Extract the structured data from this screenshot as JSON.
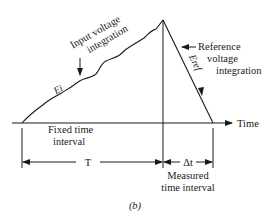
{
  "diagram": {
    "type": "dual-slope integrating ADC waveform",
    "labels": {
      "input_integration_line1": "Input voltage",
      "input_integration_line2": "integration",
      "reference_integration_line1": "Reference",
      "reference_integration_line2": "voltage",
      "reference_integration_line3": "integration",
      "input_voltage_symbol": "Ei",
      "reference_voltage_symbol": "Eref",
      "time_axis": "Time",
      "fixed_interval_line1": "Fixed time",
      "fixed_interval_line2": "interval",
      "fixed_interval_symbol": "T",
      "measured_interval_symbol": "Δt",
      "measured_interval_line1": "Measured",
      "measured_interval_line2": "time interval",
      "caption": "(b)"
    },
    "colors": {
      "stroke": "#1a1a1a",
      "background": "#ffffff"
    }
  }
}
